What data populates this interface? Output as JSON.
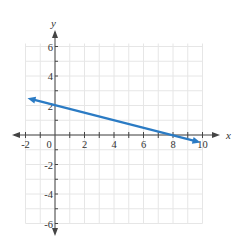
{
  "chart_data": {
    "type": "line",
    "title": "",
    "xlabel": "x",
    "ylabel": "y",
    "xlim": [
      -2,
      10
    ],
    "ylim": [
      -6,
      6
    ],
    "grid": true,
    "grid_step": 1,
    "x_ticks": [
      -2,
      0,
      2,
      4,
      6,
      8,
      10
    ],
    "y_ticks": [
      -6,
      -4,
      -2,
      2,
      4,
      6
    ],
    "x_tick_labels": [
      "-2",
      "0",
      "2",
      "4",
      "6",
      "8",
      "10"
    ],
    "y_tick_labels": [
      "-6",
      "-4",
      "-2",
      "2",
      "4",
      "6"
    ],
    "series": [
      {
        "name": "line",
        "equation": "y = -0.25x + 2",
        "x": [
          -2,
          0,
          8,
          10
        ],
        "y": [
          2.5,
          2,
          0,
          -0.5
        ],
        "arrows_both_ends": true,
        "color": "#2b7bc4"
      }
    ],
    "legend": "none"
  },
  "labels": {
    "x_axis": "x",
    "y_axis": "y",
    "origin": "0"
  },
  "colors": {
    "line": "#2b7bc4",
    "axis": "#444444",
    "grid": "#e6e6e6"
  }
}
